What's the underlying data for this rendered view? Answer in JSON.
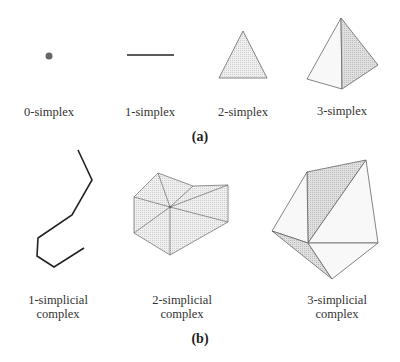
{
  "panel_a": {
    "caption": "(a)",
    "items": [
      {
        "label": "0-simplex",
        "shape": "point"
      },
      {
        "label": "1-simplex",
        "shape": "line-segment"
      },
      {
        "label": "2-simplex",
        "shape": "triangle"
      },
      {
        "label": "3-simplex",
        "shape": "tetrahedron"
      }
    ]
  },
  "panel_b": {
    "caption": "(b)",
    "items": [
      {
        "label_line1": "1-simplicial",
        "label_line2": "complex",
        "shape": "polyline"
      },
      {
        "label_line1": "2-simplicial",
        "label_line2": "complex",
        "shape": "triangulated-polygon"
      },
      {
        "label_line1": "3-simplicial",
        "label_line2": "complex",
        "shape": "tetrahedral-complex"
      }
    ]
  },
  "colors": {
    "stroke": "#555555",
    "fill_light": "#ececec",
    "fill_shaded": "#d6d6d6",
    "point": "#666666",
    "edge_dark": "#222222"
  }
}
